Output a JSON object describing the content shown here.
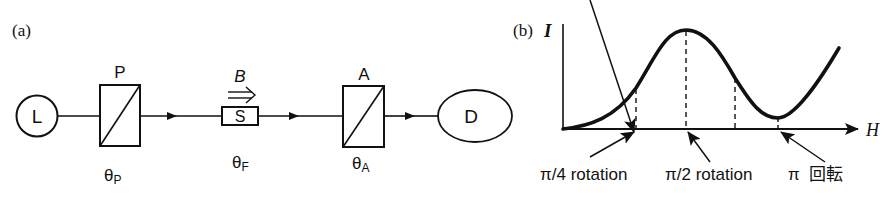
{
  "panel_a": {
    "label": "(a)",
    "components": {
      "light_source": {
        "symbol": "L"
      },
      "polarizer": {
        "label": "P",
        "angle_label": "θ",
        "angle_sub": "P"
      },
      "sample": {
        "symbol": "S",
        "field_label": "B",
        "field_arrow": "⇒",
        "angle_label": "θ",
        "angle_sub": "F"
      },
      "analyzer": {
        "label": "A",
        "angle_label": "θ",
        "angle_sub": "A"
      },
      "detector": {
        "symbol": "D"
      }
    }
  },
  "panel_b": {
    "label": "(b)",
    "y_axis_label": "I",
    "x_axis_label": "H",
    "annotations": [
      {
        "text": "π/4 rotation"
      },
      {
        "text": "π/2 rotation"
      },
      {
        "text": "π  回転"
      }
    ]
  },
  "colors": {
    "ink": "#111111",
    "background": "#ffffff"
  }
}
